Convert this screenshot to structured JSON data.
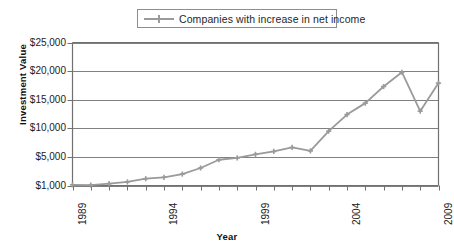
{
  "chart_data": {
    "type": "line",
    "title": "",
    "xlabel": "Year",
    "ylabel": "Investment Value",
    "legend_position": "top-center",
    "grid": true,
    "ylim": [
      1000,
      25000
    ],
    "ytick_labels": [
      "$1,000",
      "$5,000",
      "$10,000",
      "$15,000",
      "$20,000",
      "$25,000"
    ],
    "ytick_values": [
      1000,
      5000,
      10000,
      15000,
      20000,
      25000
    ],
    "xlim": [
      1989,
      2009
    ],
    "xtick_labels": [
      "1989",
      "1994",
      "1999",
      "2004",
      "2009"
    ],
    "xtick_values": [
      1989,
      1994,
      1999,
      2004,
      2009
    ],
    "x": [
      1989,
      1990,
      1991,
      1992,
      1993,
      1994,
      1995,
      1996,
      1997,
      1998,
      1999,
      2000,
      2001,
      2002,
      2003,
      2004,
      2005,
      2006,
      2007,
      2008,
      2009
    ],
    "series": [
      {
        "name": "Companies with increase in net income",
        "color": "#9a9a9a",
        "marker": "plus",
        "values": [
          1100,
          1050,
          1250,
          1500,
          1950,
          2150,
          2600,
          3450,
          4600,
          4850,
          5450,
          5950,
          6650,
          6050,
          9500,
          12400,
          14400,
          17300,
          19800,
          13000,
          17900
        ]
      }
    ]
  },
  "legend": {
    "entries": [
      {
        "label": "Companies with increase in net income",
        "color": "#9a9a9a"
      }
    ]
  },
  "axes": {
    "y_title": "Investment Value",
    "x_title": "Year"
  }
}
